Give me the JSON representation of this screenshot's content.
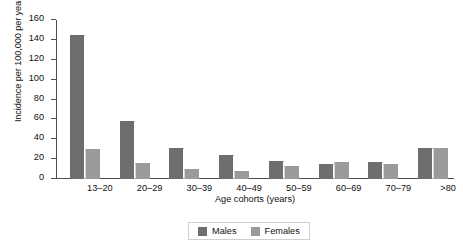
{
  "chart_data": {
    "type": "bar",
    "title": "",
    "subtitle": "",
    "xlabel": "Age cohorts (years)",
    "ylabel": "Incidence per 100,000 per year",
    "categories": [
      "13–20",
      "20–29",
      "30–39",
      "40–49",
      "50–59",
      "60–69",
      "70–79",
      ">80"
    ],
    "series": [
      {
        "name": "Males",
        "color": "#6e6e6e",
        "values": [
          145,
          58,
          31,
          24,
          18,
          15,
          17,
          31
        ]
      },
      {
        "name": "Females",
        "color": "#9a9a9a",
        "values": [
          30,
          16,
          10,
          8,
          13,
          17,
          15,
          31
        ]
      }
    ],
    "ylim": [
      0,
      160
    ],
    "yticks": [
      0,
      20,
      40,
      60,
      80,
      100,
      120,
      140,
      160
    ],
    "ytick_labels": [
      "0",
      "20",
      "40",
      "60",
      "80",
      "100",
      "120",
      "140",
      "160"
    ],
    "grid": false,
    "legend_position": "bottom-center",
    "legend_entries": [
      "Males",
      "Females"
    ]
  }
}
